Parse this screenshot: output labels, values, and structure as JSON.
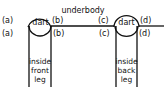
{
  "diagram": {
    "title_label": "underbody",
    "left_dart": {
      "label": "dart",
      "top_left": "(a)",
      "bottom_left": "(a)",
      "top_right": "(b)",
      "bottom_right": "(b)",
      "leg_label_line1": "inside",
      "leg_label_line2": "front",
      "leg_label_line3": "leg"
    },
    "right_dart": {
      "label": "dart",
      "top_left": "(c)",
      "bottom_left": "(c)",
      "top_right": "(d)",
      "bottom_right": "(d)",
      "leg_label_line1": "inside",
      "leg_label_line2": "back",
      "leg_label_line3": "leg"
    },
    "colors": {
      "line": "#111111",
      "background": "#ffffff"
    }
  }
}
